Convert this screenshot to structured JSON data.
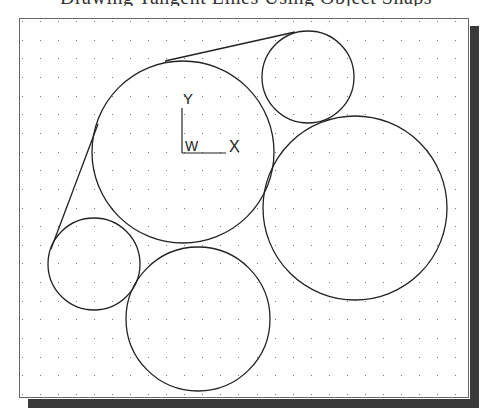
{
  "caption": {
    "text": "Drawing Tangent Lines Using Object Snaps",
    "visible": "partially cut off at top edge"
  },
  "viewport": {
    "frame": {
      "left": 19,
      "top": 18,
      "right": 470,
      "bottom": 399
    },
    "shadow_color": "#3a3a3a",
    "background": "#ffffff",
    "grid": {
      "type": "dots",
      "x_start": 22,
      "x_end": 455,
      "x_spacing": 18.04,
      "y_start": 21,
      "y_end": 394,
      "y_spacing": 18.65,
      "color": "#777777"
    }
  },
  "ucs_icon": {
    "y_label": "Y",
    "x_label": "X",
    "w_label": "W",
    "origin": [
      182,
      153
    ]
  },
  "geometry": {
    "stroke": "#222222",
    "circles": [
      {
        "name": "large-center-circle",
        "cx": 183,
        "cy": 152,
        "r": 91
      },
      {
        "name": "small-top-right-circle",
        "cx": 308,
        "cy": 77,
        "r": 46
      },
      {
        "name": "large-right-circle",
        "cx": 355,
        "cy": 208,
        "r": 92
      },
      {
        "name": "small-left-circle",
        "cx": 94,
        "cy": 264,
        "r": 46
      },
      {
        "name": "bottom-circle",
        "cx": 198,
        "cy": 319,
        "r": 72
      }
    ],
    "lines": [
      {
        "name": "top-tangent-line",
        "x1": 165,
        "y1": 61,
        "x2": 295,
        "y2": 32
      },
      {
        "name": "left-tangent-line",
        "x1": 51,
        "y1": 249,
        "x2": 98,
        "y2": 124
      }
    ]
  }
}
